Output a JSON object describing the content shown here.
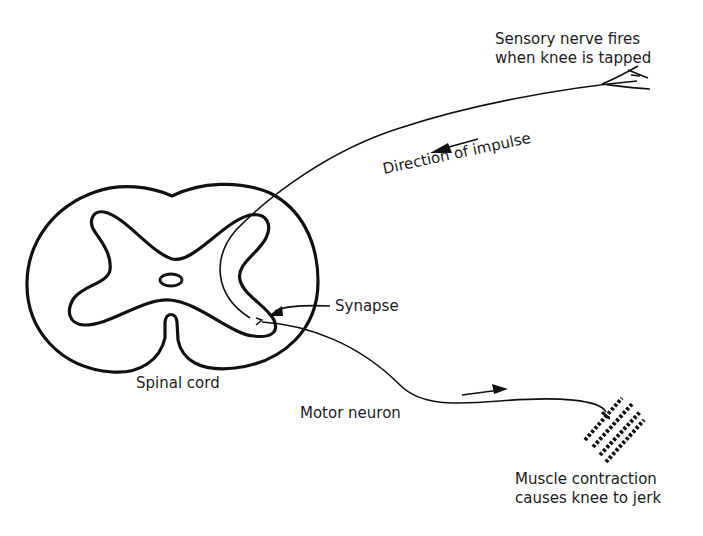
{
  "diagram": {
    "type": "biological-process",
    "top_caption_partial": "... the spinal reflex ...",
    "labels": {
      "sensory": [
        "Sensory nerve fires",
        "when knee is tapped"
      ],
      "direction": "Direction of impulse",
      "synapse": "Synapse",
      "spinal_cord": "Spinal cord",
      "motor_neuron": "Motor neuron",
      "muscle": [
        "Muscle contraction",
        "causes knee to jerk"
      ]
    },
    "nodes": [
      {
        "id": "receptor",
        "name": "Sensory receptor (knee)"
      },
      {
        "id": "sensory_nerve",
        "name": "Sensory nerve"
      },
      {
        "id": "synapse",
        "name": "Synapse"
      },
      {
        "id": "spinal_cord",
        "name": "Spinal cord"
      },
      {
        "id": "motor_neuron",
        "name": "Motor neuron"
      },
      {
        "id": "muscle",
        "name": "Muscle"
      }
    ],
    "edges": [
      {
        "from": "receptor",
        "to": "synapse",
        "via": "sensory_nerve",
        "label": "Direction of impulse"
      },
      {
        "from": "synapse",
        "to": "muscle",
        "via": "motor_neuron"
      }
    ],
    "colors": {
      "ink": "#111111",
      "background": "#ffffff"
    }
  }
}
